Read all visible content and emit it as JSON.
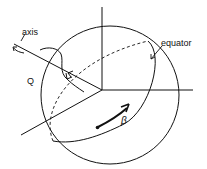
{
  "diagram": {
    "labels": {
      "axis": "axis",
      "equator": "equator",
      "q": "Q",
      "beta": "β"
    },
    "colors": {
      "ink": "#111111",
      "background": "#ffffff"
    }
  }
}
